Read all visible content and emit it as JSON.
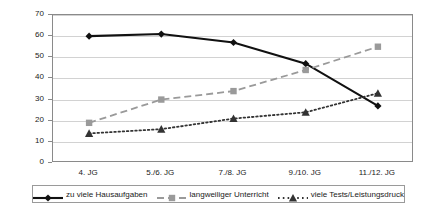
{
  "chart_data": {
    "type": "line",
    "title": "",
    "subtitle": "",
    "xlabel": "",
    "ylabel": "Prozent",
    "ylim": [
      0,
      70
    ],
    "ytick_step": 10,
    "yticks": [
      0,
      10,
      20,
      30,
      40,
      50,
      60,
      70
    ],
    "grid": true,
    "legend_position": "bottom",
    "categories": [
      "4. JG",
      "5./6. JG",
      "7./8. JG",
      "9./10. JG",
      "11./12. JG"
    ],
    "series": [
      {
        "name": "zu viele Hausaufgaben",
        "values": [
          60,
          61,
          57,
          47,
          27
        ],
        "color": "#111111",
        "marker": "diamond",
        "line_style": "solid"
      },
      {
        "name": "langweiliger Unterricht",
        "values": [
          19,
          30,
          34,
          44,
          55
        ],
        "color": "#9a9a9a",
        "marker": "square",
        "line_style": "dashed"
      },
      {
        "name": "viele Tests/Leistungsdruck",
        "values": [
          14,
          16,
          21,
          24,
          33
        ],
        "color": "#333333",
        "marker": "triangle",
        "line_style": "dotted"
      }
    ]
  },
  "axis": {
    "y_title": "Prozent",
    "y_tick_labels": [
      "70",
      "60",
      "50",
      "40",
      "30",
      "20",
      "10",
      "0"
    ],
    "x_tick_labels": [
      "4. JG",
      "5./6. JG",
      "7./8. JG",
      "9./10. JG",
      "11./12. JG"
    ]
  },
  "legend": {
    "items": [
      {
        "label": "zu viele Hausaufgaben"
      },
      {
        "label": "langweiliger Unterricht"
      },
      {
        "label": "viele Tests/Leistungsdruck"
      }
    ]
  }
}
